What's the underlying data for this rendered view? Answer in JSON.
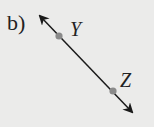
{
  "figure": {
    "problem_label": "b)",
    "line": {
      "type": "line-with-arrows-both-ends",
      "start": [
        40,
        16
      ],
      "end": [
        132,
        112
      ],
      "color": "#1a1a1a"
    },
    "points": [
      {
        "name": "Y",
        "x": 59,
        "y": 36,
        "color": "#8a8a8a"
      },
      {
        "name": "Z",
        "x": 113,
        "y": 91,
        "color": "#8a8a8a"
      }
    ],
    "labels": {
      "y": "Y",
      "z": "Z"
    },
    "background_color": "#ebebea"
  }
}
